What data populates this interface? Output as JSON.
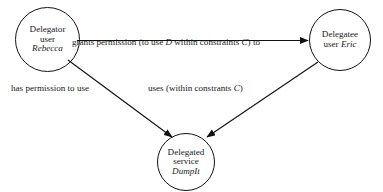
{
  "diagram": {
    "background_color": "#ffffff",
    "stroke_color": "#121212",
    "nodes": [
      {
        "id": "delegator",
        "role_label": "Delegator",
        "kind_label": "user",
        "name_label": "Rebecca",
        "shape": "circle"
      },
      {
        "id": "delegatee",
        "role_label": "Delegatee",
        "kind_label": "user",
        "name_label": "Eric",
        "shape": "circle"
      },
      {
        "id": "service",
        "role_label": "Delegated",
        "kind_label": "service",
        "name_label": "DumpIt",
        "shape": "circle"
      }
    ],
    "edges": [
      {
        "id": "grants",
        "from": "delegator",
        "to": "delegatee",
        "label_prefix": "grants permission (to use ",
        "label_var1": "D",
        "label_middle": " within constraints ",
        "label_var2": "C",
        "label_suffix": ") to"
      },
      {
        "id": "has-permission",
        "from": "delegator",
        "to": "service",
        "label": "has permission to use"
      },
      {
        "id": "uses",
        "from": "delegatee",
        "to": "service",
        "label_prefix": "uses (within constrants ",
        "label_var1": "C",
        "label_suffix": ")"
      }
    ]
  }
}
